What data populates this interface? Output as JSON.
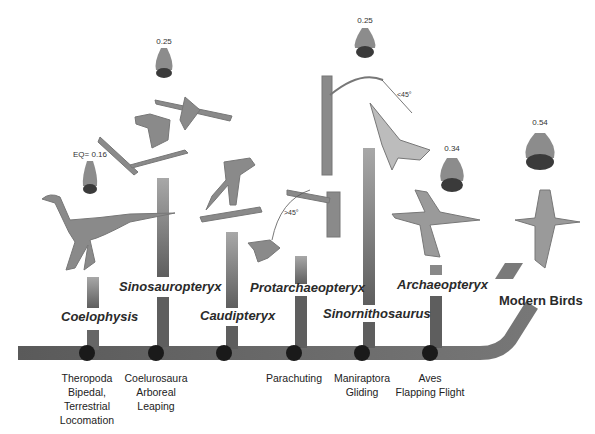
{
  "figure": {
    "colors": {
      "trunk": "#6e6e6e",
      "bar_top": "#a8a8a8",
      "bar_bottom": "#5e5e5e",
      "node": "#1a1a1a",
      "illustration": "#8a8a8a",
      "brain_fore": "#8c8c8c",
      "brain_hind": "#3a3a3a"
    }
  },
  "taxa": [
    {
      "name": "Coelophysis",
      "eq": "EQ= 0.16"
    },
    {
      "name": "Sinosauropteryx",
      "eq": "0.25"
    },
    {
      "name": "Caudipteryx",
      "eq": ""
    },
    {
      "name": "Protarchaeopteryx",
      "eq": ""
    },
    {
      "name": "Sinornithosaurus",
      "eq": "0.25"
    },
    {
      "name": "Archaeopteryx",
      "eq": "0.34"
    },
    {
      "name": "Modern Birds",
      "eq": "0.54"
    }
  ],
  "nodes": [
    {
      "lines": [
        "Theropoda",
        "Bipedal,",
        "Terrestrial",
        "Locomation"
      ]
    },
    {
      "lines": [
        "Coelurosaura",
        "Arboreal",
        "Leaping"
      ]
    },
    {
      "lines": []
    },
    {
      "lines": [
        "Parachuting"
      ]
    },
    {
      "lines": [
        "Maniraptora",
        "Gliding"
      ]
    },
    {
      "lines": [
        "Aves",
        "Flapping Flight"
      ]
    }
  ],
  "annotations": {
    "angle_parachute": ">45°",
    "angle_glide": "<45°"
  }
}
